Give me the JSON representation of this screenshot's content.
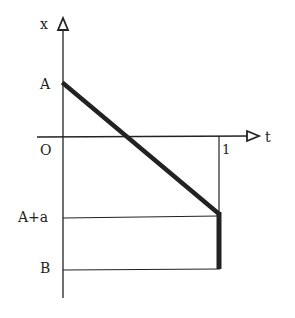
{
  "diagram": {
    "axes": {
      "x_axis_label": "t",
      "y_axis_label": "x",
      "origin_label": "O",
      "t_tick_label": "1"
    },
    "y_labels": {
      "A": "A",
      "A_plus_a": "A+a",
      "B": "B"
    },
    "colors": {
      "line": "#222222",
      "background": "#ffffff"
    },
    "segments": [
      {
        "name": "descending-line",
        "from": [
          "0",
          "A"
        ],
        "to": [
          "1",
          "A+a"
        ],
        "weight": "thick"
      },
      {
        "name": "jump-segment",
        "from": [
          "1",
          "A+a"
        ],
        "to": [
          "1",
          "B"
        ],
        "weight": "thick"
      }
    ]
  }
}
